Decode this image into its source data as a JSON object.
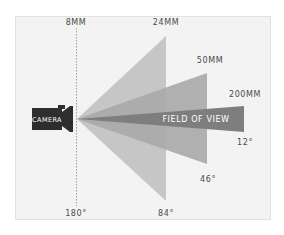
{
  "diagram": {
    "camera_label": "CAMERA",
    "field_of_view_label": "FIELD OF VIEW",
    "lenses": [
      {
        "focal_length": "8MM",
        "angle": "180°"
      },
      {
        "focal_length": "24MM",
        "angle": "84°"
      },
      {
        "focal_length": "50MM",
        "angle": "46°"
      },
      {
        "focal_length": "200MM",
        "angle": "12°"
      }
    ],
    "colors": {
      "background": "#f3f3f3",
      "wedge_24mm": "#c4c4c4",
      "wedge_50mm": "#a9a9a9",
      "wedge_200mm": "#7f7f7f",
      "camera": "#2e2e2e",
      "text": "#4a4a4a"
    }
  }
}
